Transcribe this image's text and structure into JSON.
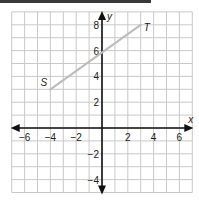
{
  "diagram": {
    "type": "coordinate-plane",
    "x_axis": {
      "label": "x",
      "range": [
        -7,
        7
      ],
      "tick_labels": [
        "−6",
        "−4",
        "−2",
        "2",
        "4",
        "6"
      ],
      "tick_values": [
        -6,
        -4,
        -2,
        2,
        4,
        6
      ]
    },
    "y_axis": {
      "label": "y",
      "range": [
        -5,
        9
      ],
      "tick_labels": [
        "−4",
        "−2",
        "2",
        "4",
        "6",
        "8"
      ],
      "tick_values": [
        -4,
        -2,
        2,
        4,
        6,
        8
      ]
    },
    "grid": true,
    "segment": {
      "color": "#bdbdbd",
      "start": {
        "label": "S",
        "x": -4,
        "y": 3
      },
      "end": {
        "label": "T",
        "x": 3,
        "y": 8
      }
    }
  }
}
